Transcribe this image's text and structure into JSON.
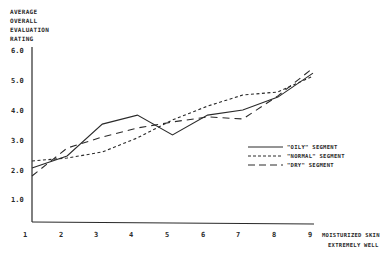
{
  "chart_data": {
    "type": "line",
    "title": "",
    "xlabel": "Moisturized skin extremely well",
    "xlabel_lines": [
      "MOISTURIZED SKIN",
      "EXTREMELY WELL"
    ],
    "ylabel": "Average Overall Evaluation Rating",
    "ylabel_lines": [
      "AVERAGE",
      "OVERALL",
      "EVALUATION",
      "RATING"
    ],
    "x": [
      1,
      2,
      3,
      4,
      5,
      6,
      7,
      8,
      9
    ],
    "x_tick_labels": [
      "1",
      "2",
      "3",
      "4",
      "5",
      "6",
      "7",
      "8",
      "9"
    ],
    "y_tick_labels": [
      "6.0",
      "5.0",
      "4.0",
      "3.0",
      "2.0",
      "1.0"
    ],
    "y_ticks": [
      6.0,
      5.0,
      4.0,
      3.0,
      2.0,
      1.0
    ],
    "ylim": [
      0.3,
      6.0
    ],
    "xlim": [
      1,
      9
    ],
    "grid": false,
    "legend_position": "right-middle",
    "series": [
      {
        "name": "\"OILY\" SEGMENT",
        "style": "solid",
        "values": [
          2.07,
          2.47,
          3.53,
          3.83,
          3.17,
          3.83,
          4.0,
          4.43,
          5.23
        ]
      },
      {
        "name": "\"NORMAL\" SEGMENT",
        "style": "short-dash",
        "values": [
          2.3,
          2.4,
          2.6,
          3.07,
          3.67,
          4.13,
          4.5,
          4.6,
          5.13
        ]
      },
      {
        "name": "\"DRY\" SEGMENT",
        "style": "long-dash",
        "values": [
          1.8,
          2.73,
          3.1,
          3.4,
          3.6,
          3.77,
          3.7,
          4.47,
          5.4
        ]
      }
    ]
  },
  "colors": {
    "ink": "#2a2a2a",
    "background": "#ffffff"
  }
}
